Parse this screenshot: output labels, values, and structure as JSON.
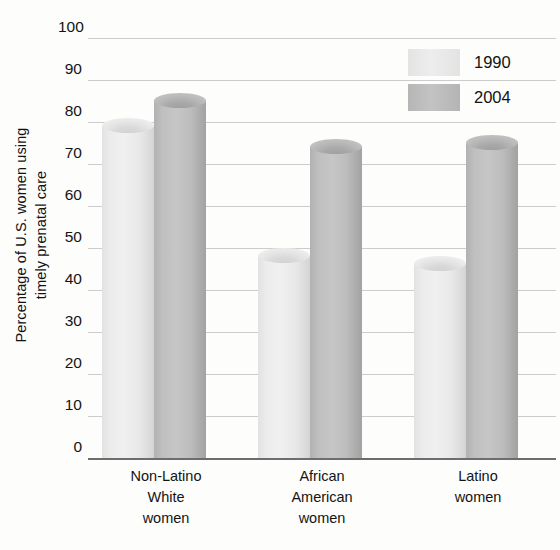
{
  "chart_data": {
    "type": "bar",
    "title": "",
    "xlabel": "",
    "ylabel_line1": "Percentage of U.S. women using",
    "ylabel_line2": "timely prenatal care",
    "categories": [
      {
        "lines": [
          "Non-Latino",
          "White",
          "women"
        ]
      },
      {
        "lines": [
          "African",
          "American",
          "women"
        ]
      },
      {
        "lines": [
          "Latino",
          "women"
        ]
      }
    ],
    "series": [
      {
        "name": "1990",
        "color": "#ebebeb",
        "values": [
          81,
          50,
          48
        ]
      },
      {
        "name": "2004",
        "color": "#bdbdbd",
        "values": [
          87,
          76,
          77
        ]
      }
    ],
    "ylim": [
      0,
      100
    ],
    "ytick_values": [
      100,
      90,
      80,
      70,
      60,
      50,
      40,
      30,
      20,
      10,
      0
    ],
    "ytick_labels": [
      "100",
      "90",
      "80",
      "70",
      "60",
      "50",
      "40",
      "30",
      "20",
      "10",
      "0"
    ],
    "grid": true,
    "legend_position": "top-right",
    "gridline_color": "#c9c9c9",
    "axis_color": "#6d6d6d",
    "background_color": "#fdfdfc"
  }
}
